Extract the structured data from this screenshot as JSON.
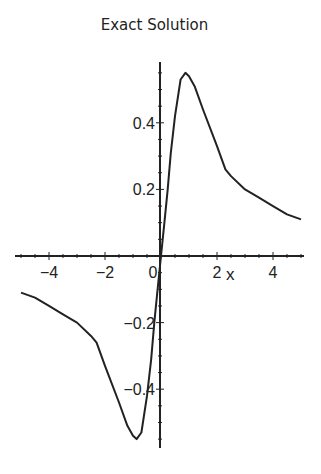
{
  "chart_data": {
    "type": "line",
    "title": "Exact Solution",
    "xlabel": "x",
    "ylabel": "",
    "xlim": [
      -5,
      5
    ],
    "ylim": [
      -0.58,
      0.58
    ],
    "grid": false,
    "legend": null,
    "xticks": [
      -4,
      -2,
      0,
      2,
      4
    ],
    "xtick_labels": [
      "−4",
      "−2",
      "0",
      "2",
      "4"
    ],
    "yticks": [
      0.4,
      0.2,
      -0.2,
      -0.4
    ],
    "ytick_labels": [
      "0.4",
      "0.2",
      "−0.2",
      "−0.4"
    ],
    "series": [
      {
        "name": "exact solution",
        "color": "#222222",
        "x": [
          -5,
          -4.5,
          -4,
          -3.5,
          -3,
          -2.5,
          -2.3,
          -2,
          -1.5,
          -1.2,
          -1,
          -0.87,
          -0.7,
          -0.5,
          -0.35,
          -0.24,
          -0.12,
          0,
          0.12,
          0.24,
          0.35,
          0.5,
          0.7,
          0.87,
          1,
          1.2,
          1.5,
          2,
          2.3,
          2.5,
          3,
          3.5,
          4,
          4.5,
          5
        ],
        "y": [
          -0.11,
          -0.125,
          -0.15,
          -0.175,
          -0.2,
          -0.24,
          -0.26,
          -0.33,
          -0.44,
          -0.51,
          -0.54,
          -0.55,
          -0.53,
          -0.42,
          -0.31,
          -0.2,
          -0.1,
          0,
          0.1,
          0.2,
          0.31,
          0.42,
          0.53,
          0.55,
          0.54,
          0.51,
          0.44,
          0.33,
          0.26,
          0.24,
          0.2,
          0.175,
          0.15,
          0.125,
          0.11
        ]
      }
    ]
  },
  "layout": {
    "x0_px": 161,
    "x_scale": 28,
    "y0_px": 256,
    "y_scale": 333,
    "x_axis_from": 15,
    "x_axis_to": 304,
    "y_axis_from": 62,
    "y_axis_to": 448
  }
}
